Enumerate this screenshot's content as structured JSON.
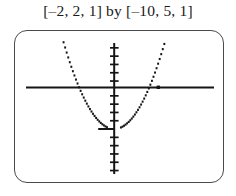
{
  "window_title": "[–2, 2, 1] by [–10, 5, 1]",
  "caption_parts": {
    "x_window_label": "[–2, 2, 1]",
    "connector": "by",
    "y_window_label": "[–10, 5, 1]"
  },
  "colors": {
    "ink": "#1a1a1a",
    "screen_border": "#4a4a4a",
    "screen_fill": "#ffffff",
    "axis": "#151515",
    "curve": "#151515"
  },
  "chart_data": {
    "type": "line",
    "title": "[–2, 2, 1] by [–10, 5, 1]",
    "xlabel": "",
    "ylabel": "",
    "xlim": [
      -2,
      2
    ],
    "ylim": [
      -10,
      5
    ],
    "xscale": 1,
    "yscale": 1,
    "grid": false,
    "legend": null,
    "axis_style": "tick-marks",
    "x_axis_ticks": [
      -2,
      -1,
      1,
      2
    ],
    "y_axis_ticks": [
      -10,
      -9,
      -8,
      -7,
      -6,
      -5,
      -4,
      -3,
      -2,
      -1,
      1,
      2,
      3,
      4,
      5
    ],
    "render_style": "pixelated-dotted",
    "series": [
      {
        "name": "parabola",
        "equation": "y = 9x^2 - 5",
        "vertex": [
          0,
          -5
        ],
        "x_intercepts": [
          -0.745,
          0.745
        ],
        "y_intercept": -5,
        "x": [
          -1.12,
          -1.05,
          -0.98,
          -0.9,
          -0.82,
          -0.75,
          -0.67,
          -0.58,
          -0.5,
          -0.4,
          -0.3,
          -0.2,
          -0.1,
          0.0,
          0.1,
          0.2,
          0.3,
          0.4,
          0.5,
          0.58,
          0.67,
          0.75,
          0.82,
          0.9,
          0.98,
          1.05,
          1.12
        ],
        "y": [
          6.3,
          4.9,
          3.6,
          2.3,
          1.1,
          0.06,
          -0.96,
          -1.97,
          -2.75,
          -3.56,
          -4.19,
          -4.64,
          -4.91,
          -5.0,
          -4.91,
          -4.64,
          -4.19,
          -3.56,
          -2.75,
          -1.97,
          -0.96,
          0.06,
          1.1,
          2.3,
          3.6,
          4.9,
          6.3
        ]
      }
    ]
  }
}
